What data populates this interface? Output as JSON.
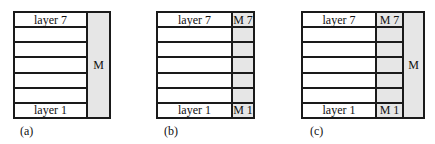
{
  "panels": [
    {
      "caption": "(a)",
      "layers": [
        "layer 7",
        "",
        "",
        "",
        "",
        "",
        "layer 1"
      ],
      "shared_memory_label": "M"
    },
    {
      "caption": "(b)",
      "layers": [
        "layer 7",
        "",
        "",
        "",
        "",
        "",
        "layer 1"
      ],
      "per_layer_memory": [
        "M 7",
        "",
        "",
        "",
        "",
        "",
        "M 1"
      ]
    },
    {
      "caption": "(c)",
      "layers": [
        "layer 7",
        "",
        "",
        "",
        "",
        "",
        "layer 1"
      ],
      "per_layer_memory": [
        "M 7",
        "",
        "",
        "",
        "",
        "",
        "M 1"
      ],
      "shared_memory_label": "M"
    }
  ],
  "colors": {
    "memory_fill": "#e6e6e6",
    "border": "#1a1a1a"
  }
}
